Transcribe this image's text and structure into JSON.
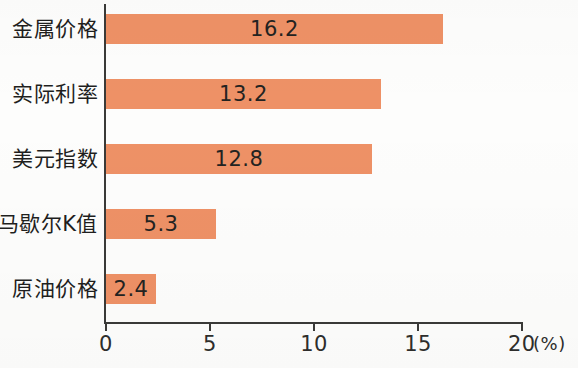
{
  "chart_data": {
    "type": "bar",
    "orientation": "horizontal",
    "title": "",
    "subtitle": "",
    "xlabel": "",
    "ylabel": "",
    "unit_label": "(%)",
    "categories": [
      "金属价格",
      "实际利率",
      "美元指数",
      "马歇尔K值",
      "原油价格"
    ],
    "values": [
      16.2,
      13.2,
      12.8,
      5.3,
      2.4
    ],
    "value_labels": [
      "16.2",
      "13.2",
      "12.8",
      "5.3",
      "2.4"
    ],
    "xlim": [
      0,
      20
    ],
    "xticks": [
      0,
      5,
      10,
      15,
      20
    ],
    "xtick_labels": [
      "0",
      "5",
      "10",
      "15",
      "20"
    ],
    "grid": false,
    "legend": false,
    "bar_color": "#ee9166",
    "axis_color": "#3a3a38",
    "text_color": "#1f1f1e",
    "background_color": "#fdfdfc"
  }
}
